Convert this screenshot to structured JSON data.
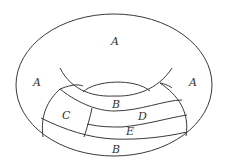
{
  "diagram": {
    "labels": {
      "a_top": "A",
      "a_left": "A",
      "a_right": "A",
      "b_upper": "B",
      "c": "C",
      "d": "D",
      "e": "E",
      "b_lower": "B"
    },
    "colors": {
      "stroke": "#3a3a3a",
      "text": "#333333",
      "background": "#ffffff"
    }
  }
}
